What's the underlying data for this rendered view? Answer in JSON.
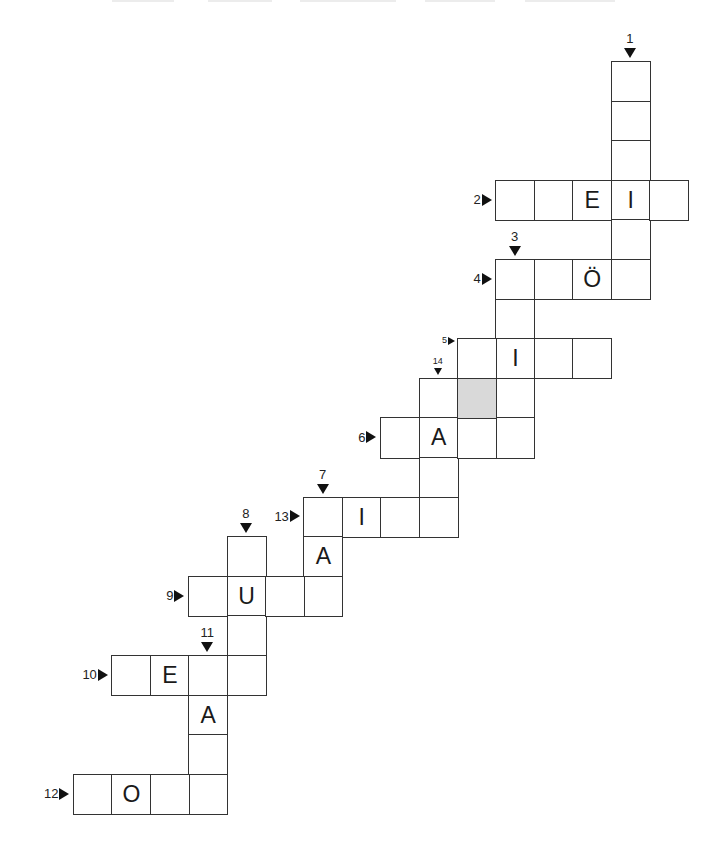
{
  "puzzle": {
    "type": "crossword",
    "grid_origin": {
      "x": 73,
      "y": 61
    },
    "cell_size": {
      "w": 38.4,
      "h": 39.6
    },
    "shaded_color": "#d9d9d9",
    "border_color": "#333333"
  },
  "clues": [
    {
      "number": "1",
      "direction": "down",
      "start": {
        "col": 14,
        "row": 0
      },
      "length": 6,
      "letters": {}
    },
    {
      "number": "2",
      "direction": "across",
      "start": {
        "col": 11,
        "row": 3
      },
      "length": 5,
      "letters": {
        "2": "E",
        "3": "I"
      }
    },
    {
      "number": "3",
      "direction": "down",
      "start": {
        "col": 11,
        "row": 5
      },
      "length": 5,
      "letters": {}
    },
    {
      "number": "4",
      "direction": "across",
      "start": {
        "col": 11,
        "row": 5
      },
      "length": 4,
      "letters": {
        "2": "Ö"
      }
    },
    {
      "number": "5",
      "direction": "across",
      "start": {
        "col": 10,
        "row": 7
      },
      "length": 4,
      "letters": {
        "1": "I"
      },
      "small": true
    },
    {
      "number": "14",
      "direction": "down",
      "start": {
        "col": 9,
        "row": 8
      },
      "length": 4,
      "letters": {},
      "small": true
    },
    {
      "number": "6",
      "direction": "across",
      "start": {
        "col": 8,
        "row": 9
      },
      "length": 4,
      "letters": {
        "1": "A"
      }
    },
    {
      "number": "13",
      "direction": "across",
      "start": {
        "col": 6,
        "row": 11
      },
      "length": 4,
      "letters": {
        "1": "I"
      }
    },
    {
      "number": "7",
      "direction": "down",
      "start": {
        "col": 6,
        "row": 11
      },
      "length": 3,
      "letters": {
        "1": "A"
      }
    },
    {
      "number": "8",
      "direction": "down",
      "start": {
        "col": 4,
        "row": 12
      },
      "length": 4,
      "letters": {}
    },
    {
      "number": "9",
      "direction": "across",
      "start": {
        "col": 3,
        "row": 13
      },
      "length": 4,
      "letters": {
        "1": "U"
      }
    },
    {
      "number": "10",
      "direction": "across",
      "start": {
        "col": 1,
        "row": 15
      },
      "length": 4,
      "letters": {
        "1": "E"
      }
    },
    {
      "number": "11",
      "direction": "down",
      "start": {
        "col": 3,
        "row": 15
      },
      "length": 4,
      "letters": {
        "1": "A"
      }
    },
    {
      "number": "12",
      "direction": "across",
      "start": {
        "col": 0,
        "row": 18
      },
      "length": 4,
      "letters": {
        "1": "O"
      }
    }
  ],
  "shaded_cells": [
    {
      "col": 10,
      "row": 8
    }
  ],
  "top_fragments": [
    {
      "x": 112,
      "w": 62
    },
    {
      "x": 208,
      "w": 64
    },
    {
      "x": 300,
      "w": 96
    },
    {
      "x": 425,
      "w": 70
    },
    {
      "x": 525,
      "w": 90
    }
  ]
}
